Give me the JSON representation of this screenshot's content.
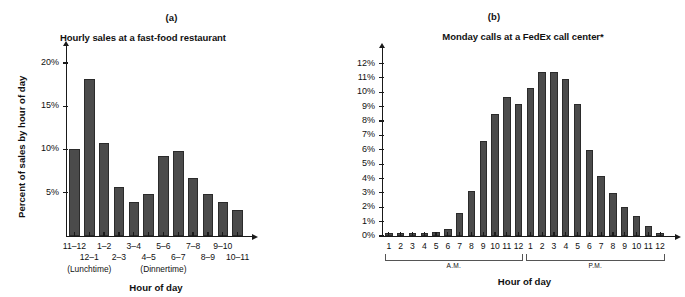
{
  "figure": {
    "panels": [
      {
        "letter": "(a)",
        "title": "Hourly sales at a fast-food restaurant",
        "ylabel": "Percent of sales by hour of day",
        "xlabel": "Hour of day",
        "annotations": [
          "(Lunchtime)",
          "(Dinnertime)"
        ]
      },
      {
        "letter": "(b)",
        "title": "Monday calls at a FedEx call center*",
        "ylabel": "",
        "xlabel": "Hour of day",
        "annotations": [
          "A.M.",
          "P.M."
        ]
      }
    ]
  },
  "chart_data": [
    {
      "type": "bar",
      "title": "Hourly sales at a fast-food restaurant",
      "panel": "(a)",
      "xlabel": "Hour of day",
      "ylabel": "Percent of sales by hour of day",
      "categories": [
        "11–12",
        "12–1",
        "1–2",
        "2–3",
        "3–4",
        "4–5",
        "5–6",
        "6–7",
        "7–8",
        "8–9",
        "9–10",
        "10–11"
      ],
      "values": [
        10.0,
        18.2,
        10.8,
        5.7,
        3.9,
        4.8,
        9.3,
        9.8,
        6.7,
        4.8,
        3.9,
        3.0
      ],
      "ylim": [
        0,
        21.5
      ],
      "ytick_values": [
        5,
        10,
        15,
        20
      ],
      "ytick_labels": [
        "5%",
        "10%",
        "15%",
        "20%"
      ],
      "grid": false,
      "legend": "none",
      "annotations": [
        {
          "text": "(Lunchtime)",
          "under_category": "12–1"
        },
        {
          "text": "(Dinnertime)",
          "under_category": "5–6"
        }
      ]
    },
    {
      "type": "bar",
      "title": "Monday calls at a FedEx call center*",
      "panel": "(b)",
      "xlabel": "Hour of day",
      "ylabel": "",
      "categories": [
        "1",
        "2",
        "3",
        "4",
        "5",
        "6",
        "7",
        "8",
        "9",
        "10",
        "11",
        "12",
        "1",
        "2",
        "3",
        "4",
        "5",
        "6",
        "7",
        "8",
        "9",
        "10",
        "11",
        "12"
      ],
      "values": [
        0.2,
        0.2,
        0.2,
        0.2,
        0.3,
        0.5,
        1.6,
        3.1,
        6.6,
        8.5,
        9.7,
        9.2,
        10.3,
        11.4,
        11.4,
        10.9,
        9.2,
        6.0,
        4.2,
        3.0,
        2.0,
        1.4,
        0.7,
        0.2
      ],
      "ylim": [
        0,
        12.8
      ],
      "ytick_values": [
        0,
        1,
        2,
        3,
        4,
        5,
        6,
        7,
        8,
        9,
        10,
        11,
        12
      ],
      "ytick_labels": [
        "0%",
        "1%",
        "2%",
        "3%",
        "4%",
        "5%",
        "6%",
        "7%",
        "8%",
        "9%",
        "10%",
        "11%",
        "12%"
      ],
      "grid": false,
      "legend": "none",
      "group_brackets": [
        {
          "label": "A.M.",
          "from_index": 0,
          "to_index": 11
        },
        {
          "label": "P.M.",
          "from_index": 12,
          "to_index": 23
        }
      ]
    }
  ],
  "colors": {
    "bar_fill": "#4b4b4b",
    "bar_stroke": "#2b2b2b",
    "axis": "#1a1a1a",
    "bracket": "#555555",
    "text": "#111111",
    "background": "#ffffff"
  }
}
